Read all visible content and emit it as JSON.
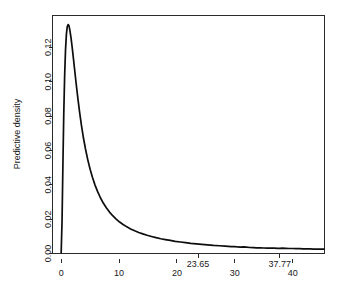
{
  "chart_data": {
    "type": "line",
    "title": "",
    "subtitle": "",
    "xlabel": "",
    "ylabel": "Predictive density",
    "xlim": [
      -1.5,
      45.5
    ],
    "ylim": [
      0.0,
      0.1385
    ],
    "grid": false,
    "legend": null,
    "x_ticks": [
      {
        "value": 0,
        "label": "0",
        "row": "lower"
      },
      {
        "value": 10,
        "label": "10",
        "row": "lower"
      },
      {
        "value": 20,
        "label": "20",
        "row": "lower"
      },
      {
        "value": 30,
        "label": "30",
        "row": "lower"
      },
      {
        "value": 40,
        "label": "40",
        "row": "lower"
      },
      {
        "value": 23.65,
        "label": "23.65",
        "row": "upper"
      },
      {
        "value": 37.77,
        "label": "37.77",
        "row": "upper"
      }
    ],
    "y_ticks": [
      {
        "value": 0.0,
        "label": "0.00"
      },
      {
        "value": 0.02,
        "label": "0.02"
      },
      {
        "value": 0.04,
        "label": "0.04"
      },
      {
        "value": 0.06,
        "label": "0.06"
      },
      {
        "value": 0.08,
        "label": "0.08"
      },
      {
        "value": 0.1,
        "label": "0.10"
      },
      {
        "value": 0.12,
        "label": "0.12"
      }
    ],
    "annotations": [
      {
        "label": "23.65",
        "x": 23.65,
        "kind": "x-axis-marker"
      },
      {
        "label": "37.77",
        "x": 37.77,
        "kind": "x-axis-marker"
      }
    ],
    "series": [
      {
        "name": "Predictive density",
        "color": "#0d0d0d",
        "x": [
          0.0,
          0.15,
          0.3,
          0.45,
          0.6,
          0.75,
          0.9,
          1.05,
          1.2,
          1.35,
          1.5,
          1.7,
          1.9,
          2.1,
          2.35,
          2.6,
          2.9,
          3.2,
          3.5,
          3.85,
          4.2,
          4.6,
          5.0,
          5.4,
          5.85,
          6.3,
          6.8,
          7.3,
          7.8,
          8.35,
          8.9,
          9.5,
          10.1,
          10.7,
          11.35,
          12.0,
          12.7,
          13.4,
          14.1,
          14.85,
          15.6,
          16.4,
          17.2,
          18.0,
          18.85,
          19.7,
          20.6,
          21.5,
          22.4,
          23.35,
          24.3,
          25.3,
          26.3,
          27.3,
          28.35,
          29.4,
          30.0,
          30.5,
          31.0,
          31.5,
          32.0,
          32.6,
          33.2,
          33.8,
          34.4,
          35.0,
          35.6,
          36.2,
          36.8,
          37.4,
          37.77,
          38.2,
          38.8,
          39.4,
          40.0,
          40.6,
          41.2,
          41.8,
          42.4,
          43.0,
          43.6,
          44.2,
          44.8,
          45.4
        ],
        "y": [
          0.0005,
          0.019,
          0.052,
          0.082,
          0.1035,
          0.1185,
          0.1275,
          0.132,
          0.1332,
          0.1325,
          0.13,
          0.1255,
          0.12,
          0.114,
          0.1062,
          0.0985,
          0.0898,
          0.0818,
          0.0745,
          0.0672,
          0.0608,
          0.0545,
          0.049,
          0.0444,
          0.0398,
          0.036,
          0.0323,
          0.0292,
          0.0266,
          0.0241,
          0.022,
          0.02,
          0.0183,
          0.0169,
          0.0155,
          0.0143,
          0.0132,
          0.0122,
          0.0114,
          0.0106,
          0.0099,
          0.0092,
          0.0086,
          0.0081,
          0.0076,
          0.0071,
          0.0067,
          0.0063,
          0.0059,
          0.0056,
          0.0053,
          0.005,
          0.0047,
          0.0045,
          0.0043,
          0.004,
          0.004,
          0.0038,
          0.0037,
          0.0038,
          0.0037,
          0.0035,
          0.0034,
          0.0033,
          0.0033,
          0.0032,
          0.0031,
          0.0032,
          0.0031,
          0.003,
          0.003,
          0.0031,
          0.003,
          0.0029,
          0.0029,
          0.0028,
          0.0028,
          0.0027,
          0.0027,
          0.0027,
          0.0026,
          0.0026,
          0.0026,
          0.0025
        ]
      }
    ]
  },
  "axes": {
    "y_title": "Predictive density"
  }
}
